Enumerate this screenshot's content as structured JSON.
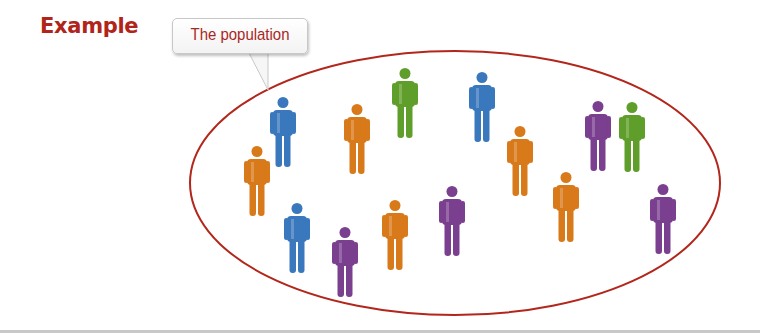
{
  "header": {
    "title": "Example"
  },
  "callout": {
    "label": "The population",
    "tail_target": [
      268,
      90
    ]
  },
  "ellipse": {
    "cx": 455,
    "cy": 183,
    "rx": 265,
    "ry": 132,
    "stroke": "#b3261b"
  },
  "colors": {
    "blue": "#3a78bd",
    "orange": "#d8791a",
    "green": "#5f9e2a",
    "purple": "#7b3f8f",
    "accent": "#b0241a"
  },
  "people": [
    {
      "color": "blue",
      "x": 270,
      "y": 97
    },
    {
      "color": "orange",
      "x": 244,
      "y": 146
    },
    {
      "color": "orange",
      "x": 344,
      "y": 104
    },
    {
      "color": "green",
      "x": 392,
      "y": 68
    },
    {
      "color": "blue",
      "x": 469,
      "y": 72
    },
    {
      "color": "orange",
      "x": 507,
      "y": 126
    },
    {
      "color": "purple",
      "x": 585,
      "y": 101
    },
    {
      "color": "green",
      "x": 619,
      "y": 102
    },
    {
      "color": "orange",
      "x": 553,
      "y": 172
    },
    {
      "color": "purple",
      "x": 650,
      "y": 184
    },
    {
      "color": "purple",
      "x": 439,
      "y": 186
    },
    {
      "color": "orange",
      "x": 382,
      "y": 200
    },
    {
      "color": "purple",
      "x": 332,
      "y": 227
    },
    {
      "color": "blue",
      "x": 284,
      "y": 203
    }
  ]
}
